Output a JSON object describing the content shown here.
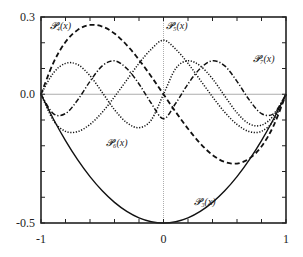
{
  "chart_data": {
    "type": "line",
    "title": "",
    "xlabel": "",
    "ylabel": "",
    "xlim": [
      -1,
      1
    ],
    "ylim": [
      -0.5,
      0.3
    ],
    "grid": false,
    "reference_lines": {
      "y0": true,
      "x0": true
    },
    "x_ticks": [
      {
        "value": -1,
        "label": "-1"
      },
      {
        "value": 0,
        "label": "0"
      },
      {
        "value": 1,
        "label": "1"
      }
    ],
    "y_ticks": [
      {
        "value": 0.3,
        "label": "0.3"
      },
      {
        "value": 0.0,
        "label": "0.0"
      },
      {
        "value": -0.5,
        "label": "-0.5"
      }
    ],
    "x_minor_ticks": [
      -0.8,
      -0.6,
      -0.4,
      -0.2,
      0.2,
      0.4,
      0.6,
      0.8
    ],
    "y_minor_ticks": [
      0.2,
      0.1,
      -0.1,
      -0.2,
      -0.3,
      -0.4
    ],
    "legend": "inline labels",
    "series": [
      {
        "name": "P3(x)",
        "label": "𝓟₃(x)",
        "style": "solid",
        "label_pos": [
          0.25,
          -0.43
        ],
        "x": [
          -1,
          -0.9,
          -0.8,
          -0.7,
          -0.6,
          -0.5,
          -0.4,
          -0.3,
          -0.2,
          -0.1,
          0,
          0.1,
          0.2,
          0.3,
          0.4,
          0.5,
          0.6,
          0.7,
          0.8,
          0.9,
          1
        ],
        "values": [
          0,
          -0.095,
          -0.18,
          -0.255,
          -0.32,
          -0.375,
          -0.42,
          -0.455,
          -0.48,
          -0.495,
          -0.5,
          -0.495,
          -0.48,
          -0.455,
          -0.42,
          -0.375,
          -0.32,
          -0.255,
          -0.18,
          -0.095,
          0
        ]
      },
      {
        "name": "P4(x)",
        "label": "𝓟₄(x)",
        "style": "dashed",
        "label_pos": [
          -0.93,
          0.255
        ],
        "x": [
          -1,
          -0.9,
          -0.8,
          -0.7,
          -0.6,
          -0.5,
          -0.4,
          -0.3,
          -0.2,
          -0.1,
          0,
          0.1,
          0.2,
          0.3,
          0.4,
          0.5,
          0.6,
          0.7,
          0.8,
          0.9,
          1
        ],
        "values": [
          0,
          0.121,
          0.203,
          0.25,
          0.269,
          0.263,
          0.236,
          0.191,
          0.134,
          0.069,
          0,
          -0.069,
          -0.134,
          -0.191,
          -0.236,
          -0.263,
          -0.269,
          -0.25,
          -0.203,
          -0.121,
          0
        ]
      },
      {
        "name": "P5(x)",
        "label": "𝓟₅(x)",
        "style": "dotted",
        "label_pos": [
          0.02,
          0.255
        ],
        "x": [
          -1,
          -0.9,
          -0.8,
          -0.7,
          -0.6,
          -0.5,
          -0.4,
          -0.3,
          -0.2,
          -0.1,
          0,
          0.1,
          0.2,
          0.3,
          0.4,
          0.5,
          0.6,
          0.7,
          0.8,
          0.9,
          1
        ],
        "values": [
          0,
          -0.101,
          -0.144,
          -0.145,
          -0.117,
          -0.07,
          -0.01,
          0.055,
          0.12,
          0.175,
          0.21,
          0.175,
          0.12,
          0.055,
          -0.01,
          -0.07,
          -0.117,
          -0.145,
          -0.144,
          -0.101,
          0
        ]
      },
      {
        "name": "P6(x)",
        "label": "𝓟₆(x)",
        "style": "dotted",
        "label_pos": [
          -0.47,
          -0.2
        ],
        "x": [
          -1,
          -0.9,
          -0.8,
          -0.7,
          -0.6,
          -0.5,
          -0.4,
          -0.3,
          -0.2,
          -0.1,
          0,
          0.1,
          0.2,
          0.3,
          0.4,
          0.5,
          0.6,
          0.7,
          0.8,
          0.9,
          1
        ],
        "values": [
          0,
          0.082,
          0.12,
          0.115,
          0.072,
          0.007,
          -0.06,
          -0.11,
          -0.13,
          -0.1,
          0,
          0.1,
          0.13,
          0.11,
          0.06,
          -0.007,
          -0.072,
          -0.115,
          -0.12,
          -0.082,
          0
        ]
      },
      {
        "name": "P7(x)",
        "label": "𝓟₇(x)",
        "style": "dash-dot",
        "label_pos": [
          0.73,
          0.125
        ],
        "x": [
          -1,
          -0.9,
          -0.8,
          -0.7,
          -0.6,
          -0.5,
          -0.4,
          -0.3,
          -0.2,
          -0.1,
          0,
          0.1,
          0.2,
          0.3,
          0.4,
          0.5,
          0.6,
          0.7,
          0.8,
          0.9,
          1
        ],
        "values": [
          0,
          -0.075,
          -0.075,
          -0.022,
          0.05,
          0.11,
          0.13,
          0.1,
          0.04,
          -0.035,
          -0.095,
          -0.035,
          0.04,
          0.1,
          0.13,
          0.11,
          0.05,
          -0.022,
          -0.075,
          -0.075,
          0
        ]
      }
    ]
  }
}
